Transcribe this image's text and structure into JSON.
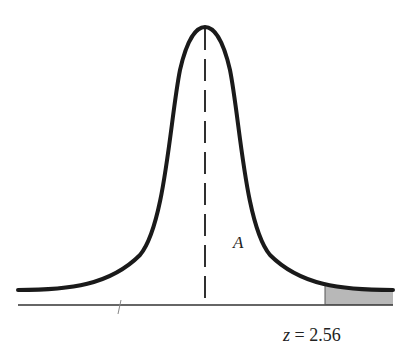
{
  "figure": {
    "type": "normal-distribution-curve",
    "area_label": "A",
    "z_label": {
      "variable": "z",
      "equals": " = ",
      "value": "2.56"
    },
    "shaded_region": "right tail beyond z = 2.56",
    "center_line": "dashed vertical line at mean"
  },
  "colors": {
    "curve": "#1a1a1a",
    "axis": "#333333",
    "shade": "#b8b8b8"
  }
}
